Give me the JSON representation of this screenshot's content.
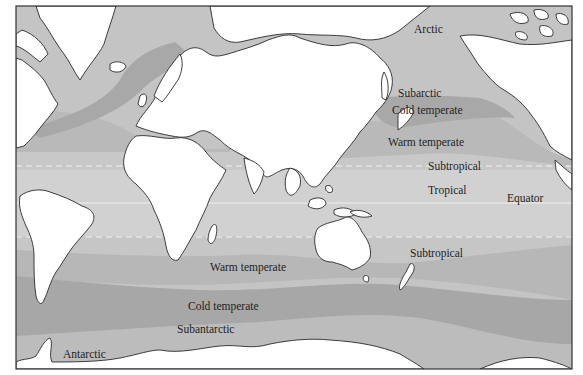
{
  "map": {
    "title": "Marine biogeographic temperature zones",
    "colors": {
      "arctic": "#c4c4c4",
      "subarctic": "#b9b9b9",
      "cold_temperate": "#a9a9a9",
      "warm_temperate": "#b8b8b8",
      "subtropical": "#c6c6c6",
      "tropical": "#d0d0d0",
      "land": "#ffffff",
      "frame": "#333333",
      "dashed_line": "#f2f2f2"
    },
    "labels": {
      "arctic": "Arctic",
      "subarctic": "Subarctic",
      "cold_temperate_north": "Cold temperate",
      "warm_temperate_north": "Warm temperate",
      "subtropical_north": "Subtropical",
      "tropical": "Tropical",
      "equator": "Equator",
      "subtropical_south": "Subtropical",
      "warm_temperate_south": "Warm temperate",
      "cold_temperate_south": "Cold temperate",
      "subantarctic": "Subantarctic",
      "antarctic": "Antarctic"
    },
    "lines": {
      "north_subtropical_boundary_y": 166,
      "equator_y": 203,
      "south_subtropical_boundary_y": 237
    }
  }
}
